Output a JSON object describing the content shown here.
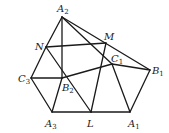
{
  "diagram": {
    "type": "geometry-figure",
    "points": {
      "A2": {
        "x": 62,
        "y": 17,
        "label": "A",
        "sub": "2",
        "lx": 57,
        "ly": 12
      },
      "N": {
        "x": 46,
        "y": 47,
        "label": "N",
        "sub": "",
        "lx": 35,
        "ly": 50
      },
      "M": {
        "x": 106,
        "y": 43,
        "label": "M",
        "sub": "",
        "lx": 104,
        "ly": 40
      },
      "C1": {
        "x": 112,
        "y": 64,
        "label": "C",
        "sub": "1",
        "lx": 111,
        "ly": 62
      },
      "B1": {
        "x": 150,
        "y": 70,
        "label": "B",
        "sub": "1",
        "lx": 152,
        "ly": 74
      },
      "C3": {
        "x": 31,
        "y": 78,
        "label": "C",
        "sub": "3",
        "lx": 18,
        "ly": 82
      },
      "B2": {
        "x": 62,
        "y": 78,
        "label": "B",
        "sub": "2",
        "lx": 62,
        "ly": 91
      },
      "A3": {
        "x": 52,
        "y": 112,
        "label": "A",
        "sub": "3",
        "lx": 45,
        "ly": 127
      },
      "L": {
        "x": 91,
        "y": 112,
        "label": "L",
        "sub": "",
        "lx": 87,
        "ly": 127
      },
      "A1": {
        "x": 130,
        "y": 112,
        "label": "A",
        "sub": "1",
        "lx": 128,
        "ly": 127
      }
    },
    "edges": [
      [
        "A2",
        "N"
      ],
      [
        "A2",
        "B2"
      ],
      [
        "A2",
        "C1"
      ],
      [
        "A2",
        "B1"
      ],
      [
        "N",
        "M"
      ],
      [
        "N",
        "C3"
      ],
      [
        "N",
        "L"
      ],
      [
        "M",
        "L"
      ],
      [
        "C1",
        "B1"
      ],
      [
        "C1",
        "B2"
      ],
      [
        "C1",
        "A1"
      ],
      [
        "C3",
        "B2"
      ],
      [
        "C3",
        "A3"
      ],
      [
        "A3",
        "B2"
      ],
      [
        "A3",
        "L"
      ],
      [
        "L",
        "A1"
      ],
      [
        "A1",
        "B1"
      ]
    ]
  }
}
